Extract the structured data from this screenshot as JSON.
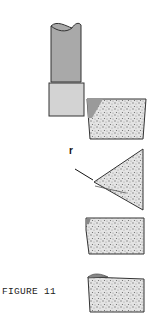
{
  "figure": {
    "caption": "FIGURE 11",
    "label_r": "r",
    "parts": [
      {
        "name": "tool-shank",
        "fill": "#a9a9a9"
      },
      {
        "name": "tool-tip-holder",
        "fill": "#d3d3d3"
      },
      {
        "name": "insert-side-view",
        "fill": "#cfcfcf"
      },
      {
        "name": "insert-triangle-top-view",
        "fill": "#c8c8c8"
      },
      {
        "name": "insert-worn-1",
        "fill": "#cfcfcf"
      },
      {
        "name": "insert-worn-2",
        "fill": "#cfcfcf"
      }
    ],
    "colors": {
      "outline": "#333333",
      "shank": "#a9a9a9",
      "holder": "#d3d3d3",
      "speckle": "#cfcfcf",
      "wedge": "#9a9a9a"
    }
  }
}
